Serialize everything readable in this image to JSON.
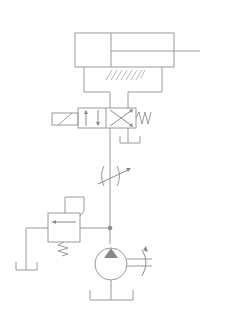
{
  "diagram": {
    "title": "",
    "type": "hydraulic-circuit",
    "line_color": "#9a9a9a",
    "background": "#ffffff",
    "components": [
      {
        "id": "cylinder",
        "label": "Single-rod double-acting hydraulic cylinder"
      },
      {
        "id": "directional-valve",
        "label": "4/2 solenoid-operated directional valve, spring return"
      },
      {
        "id": "throttle-valve",
        "label": "Adjustable throttle (flow control) valve"
      },
      {
        "id": "relief-valve",
        "label": "Pilot-operated relief valve"
      },
      {
        "id": "pump",
        "label": "Variable-displacement hydraulic pump"
      },
      {
        "id": "tank-valve",
        "label": "Tank (reservoir)"
      },
      {
        "id": "tank-relief",
        "label": "Tank (reservoir)"
      },
      {
        "id": "tank-pump",
        "label": "Tank (reservoir)"
      }
    ]
  }
}
